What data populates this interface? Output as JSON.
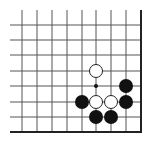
{
  "board": {
    "type": "go-board-corner",
    "corner": "bottom-right",
    "grid": {
      "columns_x": [
        22,
        37,
        52,
        67,
        82,
        96,
        111,
        126,
        141
      ],
      "rows_y": [
        25,
        40,
        55,
        71,
        86,
        102,
        117,
        132
      ],
      "line_start_x": 10,
      "line_start_y": 10,
      "edge_right_x": 141,
      "edge_bottom_y": 132,
      "line_color": "#555555",
      "edge_color": "#222222"
    },
    "stone_radius": 7,
    "stones": [
      {
        "color": "white",
        "col": 5,
        "row": 3
      },
      {
        "color": "black",
        "col": 7,
        "row": 4
      },
      {
        "color": "black",
        "col": 4,
        "row": 5
      },
      {
        "color": "white",
        "col": 5,
        "row": 5
      },
      {
        "color": "white",
        "col": 6,
        "row": 5
      },
      {
        "color": "black",
        "col": 7,
        "row": 5
      },
      {
        "color": "black",
        "col": 5,
        "row": 6
      },
      {
        "color": "black",
        "col": 6,
        "row": 6
      }
    ],
    "markers": [
      {
        "type": "dot",
        "col": 5,
        "row": 4
      }
    ],
    "colors": {
      "black_stone": "#111111",
      "white_stone": "#ffffff",
      "white_stone_outline": "#222222"
    }
  }
}
